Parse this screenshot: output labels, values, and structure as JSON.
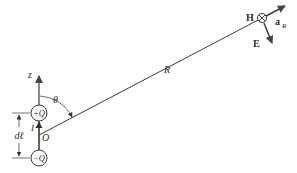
{
  "diagram": {
    "labels": {
      "z_axis": "z",
      "plus_charge": "+Q",
      "minus_charge": "−Q",
      "current": "I",
      "origin": "O",
      "dl": "dℓ",
      "theta": "θ",
      "R": "R",
      "H": "H",
      "E": "E",
      "aR_main": "a",
      "aR_sub": "R"
    },
    "colors": {
      "line": "#3a3a3a",
      "arrow": "#4a4a4a",
      "text": "#2b2b2b"
    }
  }
}
